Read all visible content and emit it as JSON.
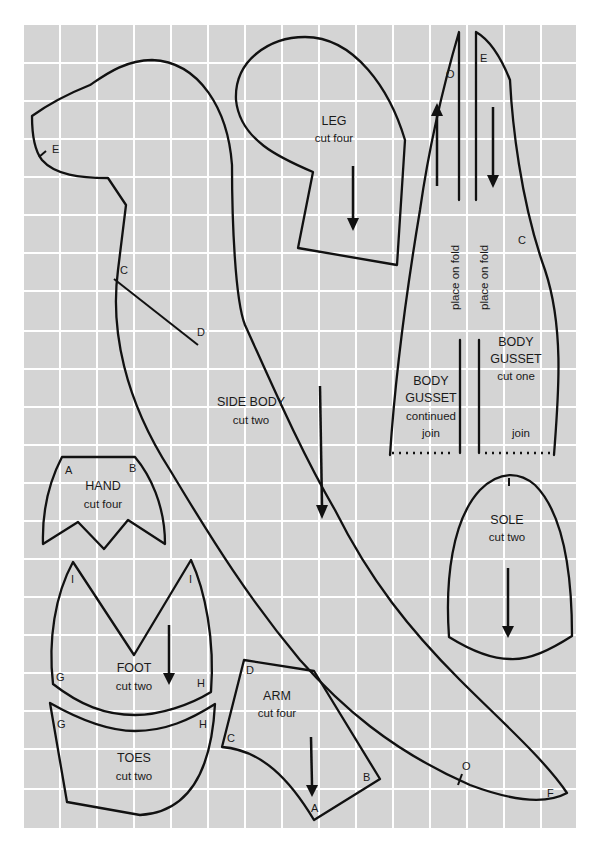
{
  "grid": {
    "background": "#d4d4d4",
    "line_color": "#ffffff",
    "x0": 24,
    "y0": 25,
    "x1": 576,
    "y1": 828,
    "cell": 37
  },
  "pieces": {
    "side_body": {
      "name": "SIDE BODY",
      "instruction": "cut two",
      "points": {
        "E": "E",
        "C": "C",
        "D": "D",
        "O": "O",
        "F": "F"
      }
    },
    "leg": {
      "name": "LEG",
      "instruction": "cut four"
    },
    "body_gusset_continued": {
      "name_line1": "BODY",
      "name_line2": "GUSSET",
      "instruction": "continued",
      "join": "join",
      "fold": "place on fold",
      "points": {
        "O": "O"
      }
    },
    "body_gusset": {
      "name_line1": "BODY",
      "name_line2": "GUSSET",
      "instruction": "cut one",
      "join": "join",
      "fold": "place on fold",
      "points": {
        "E": "E",
        "C": "C"
      }
    },
    "hand": {
      "name": "HAND",
      "instruction": "cut four",
      "points": {
        "A": "A",
        "B": "B"
      }
    },
    "foot": {
      "name": "FOOT",
      "instruction": "cut two",
      "points": {
        "I1": "I",
        "I2": "I",
        "G": "G",
        "H": "H"
      }
    },
    "toes": {
      "name": "TOES",
      "instruction": "cut two",
      "points": {
        "G": "G",
        "H": "H"
      }
    },
    "arm": {
      "name": "ARM",
      "instruction": "cut four",
      "points": {
        "D": "D",
        "C": "C",
        "B": "B",
        "A": "A"
      }
    },
    "sole": {
      "name": "SOLE",
      "instruction": "cut two",
      "points": {
        "I": "I"
      }
    }
  }
}
